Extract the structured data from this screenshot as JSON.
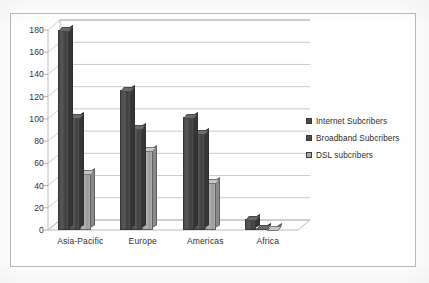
{
  "chart_data": {
    "type": "bar",
    "title": "",
    "subtitle": "",
    "xlabel": "",
    "ylabel": "",
    "categories": [
      "Asia-Pacific",
      "Europe",
      "Americas",
      "Africa"
    ],
    "series": [
      {
        "name": "Internet Subcribers",
        "color": "#4a4a4a",
        "values": [
          180,
          126,
          102,
          10
        ]
      },
      {
        "name": "Broadband Subcribers",
        "color": "#4c4c4c",
        "values": [
          102,
          92,
          87,
          2
        ]
      },
      {
        "name": "DSL subcribers",
        "color": "#a6a6a6",
        "values": [
          51,
          72,
          43,
          1
        ]
      }
    ],
    "ylim": [
      0,
      180
    ],
    "yticks": [
      0,
      20,
      40,
      60,
      80,
      100,
      120,
      140,
      160,
      180
    ],
    "ytick_labels": [
      "0",
      "20",
      "40",
      "60",
      "80",
      "100",
      "120",
      "140",
      "160",
      "180"
    ],
    "grid": true,
    "grid_axis": "y",
    "legend_position": "right",
    "style": "3d-clustered-column"
  },
  "legend": {
    "items": [
      {
        "label": "Internet Subcribers"
      },
      {
        "label": "Broadband Subcribers"
      },
      {
        "label": "DSL subcribers"
      }
    ]
  }
}
